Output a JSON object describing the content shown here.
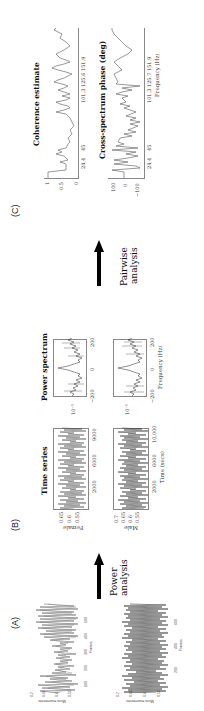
{
  "panels": {
    "A": {
      "label": "(A)",
      "plots": [
        {
          "ylabel": "Micro movements",
          "yticks": [
            "0.7",
            "0.65",
            "0.6",
            "0.55"
          ],
          "xticks": [
            "100",
            "200",
            "300",
            "400",
            "500"
          ],
          "xlabel": "Frames"
        },
        {
          "ylabel": "Micro movements",
          "yticks": [
            "0.7",
            "0.65",
            "0.6",
            "0.55"
          ],
          "xticks": [
            "200",
            "400",
            "600"
          ],
          "xlabel": "Frames"
        }
      ]
    },
    "arrow1": {
      "line1": "Power",
      "line2": "analysis"
    },
    "B": {
      "label": "(B)",
      "time_series": {
        "title": "Time series",
        "female": {
          "ylabel": "Female",
          "yticks": [
            "0.65",
            "0.6",
            "0.55"
          ],
          "xticks": [
            "2000",
            "6000",
            "9000"
          ]
        },
        "male": {
          "ylabel": "Male",
          "yticks": [
            "0.7",
            "0.65",
            "0.6",
            "0.55"
          ],
          "xticks": [
            "2000",
            "6000",
            "10,000"
          ]
        },
        "xlabel": "Time (secs)"
      },
      "power_spectrum": {
        "title": "Power spectrum",
        "ytick": "10⁻⁵",
        "xticks": [
          "−200",
          "0",
          "200"
        ],
        "xlabel": "Frequency (Hz)"
      }
    },
    "arrow2": {
      "line1": "Pairwise",
      "line2": "analysis"
    },
    "C": {
      "label": "(C)",
      "coherence": {
        "title": "Coherence estimate",
        "yticks": [
          "1",
          "0.5",
          "0"
        ],
        "xticks": [
          "24.4",
          "45",
          "101.3",
          "125.6",
          "151.9"
        ]
      },
      "cross_phase": {
        "title": "Cross-spectrum phase (deg)",
        "yticks": [
          "100",
          "0",
          "−100"
        ],
        "xticks": [
          "24.4",
          "45",
          "101.3",
          "125.7",
          "151.9"
        ],
        "xlabel": "Frequency (Hz)"
      }
    }
  }
}
